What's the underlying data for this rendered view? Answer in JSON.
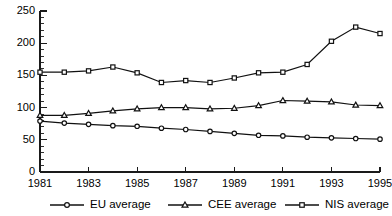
{
  "chart_data": {
    "type": "line",
    "title": "",
    "subtitle": "",
    "xlabel": "",
    "ylabel": "",
    "x": [
      1981,
      1982,
      1983,
      1984,
      1985,
      1986,
      1987,
      1988,
      1989,
      1990,
      1991,
      1992,
      1993,
      1994,
      1995
    ],
    "xlim": [
      1981,
      1995
    ],
    "ylim": [
      0,
      250
    ],
    "x_tick_labels": [
      "1981",
      "1983",
      "1985",
      "1987",
      "1989",
      "1991",
      "1993",
      "1995"
    ],
    "x_tick_values": [
      1981,
      1983,
      1985,
      1987,
      1989,
      1991,
      1993,
      1995
    ],
    "y_tick_labels": [
      "0",
      "50",
      "100",
      "150",
      "200",
      "250"
    ],
    "y_tick_values": [
      0,
      50,
      100,
      150,
      200,
      250
    ],
    "y_minor_step": 10,
    "grid": false,
    "legend_position": "bottom",
    "series": [
      {
        "name": "EU average",
        "marker": "circle",
        "values": [
          79,
          76,
          74,
          72,
          71,
          68,
          66,
          63,
          60,
          57,
          56,
          54,
          53,
          52,
          51
        ]
      },
      {
        "name": "CEE average",
        "marker": "triangle",
        "values": [
          88,
          88,
          91,
          95,
          98,
          100,
          100,
          98,
          99,
          103,
          111,
          110,
          109,
          104,
          103
        ]
      },
      {
        "name": "NIS average",
        "marker": "square",
        "values": [
          155,
          155,
          157,
          163,
          154,
          139,
          142,
          139,
          146,
          154,
          155,
          167,
          203,
          225,
          215
        ]
      }
    ],
    "colors": {
      "line": "#111111",
      "marker_fill": "#ffffff",
      "axis": "#1a1a1a",
      "background": "#ffffff"
    }
  }
}
